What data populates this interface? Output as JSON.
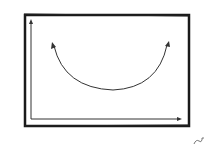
{
  "diagram": {
    "frame": {
      "x": 24,
      "y": 14,
      "width": 166,
      "height": 113,
      "stroke": "#1a1a1a"
    },
    "axes": {
      "origin": [
        31,
        119
      ],
      "y_end": [
        31,
        20
      ],
      "x_end": [
        181,
        119
      ],
      "stroke": "#333333"
    },
    "curve": {
      "shape": "U-shaped parabola",
      "start": [
        53,
        43
      ],
      "vertex": [
        113,
        90
      ],
      "end": [
        168,
        42
      ],
      "arrowheads": "both ends",
      "stroke": "#333333"
    },
    "signature": {
      "present": true,
      "position": "bottom-right",
      "glyph": "squiggle"
    }
  }
}
